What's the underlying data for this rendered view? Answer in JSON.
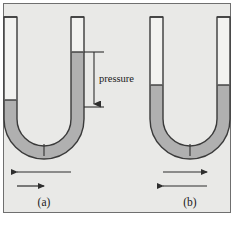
{
  "figure": {
    "background_color": "#e9e9e7",
    "border_color": "#6f6f6f",
    "fluid_color": "#b0b0b0",
    "tube_outline_color": "#3a3a3a",
    "empty_tube_color": "#f2f2f0",
    "arrow_color": "#2e2e2e",
    "text_color": "#1a1a1a"
  },
  "annotations": {
    "pressure_label": "pressure"
  },
  "panels": [
    {
      "id": "a",
      "caption": "(a)",
      "fluid_level_left": "low",
      "fluid_level_right": "high",
      "has_pressure_marker": true,
      "arrows": [
        {
          "name": "upper-arrow",
          "direction": "left",
          "length": "long"
        },
        {
          "name": "lower-arrow",
          "direction": "right",
          "length": "short"
        }
      ]
    },
    {
      "id": "b",
      "caption": "(b)",
      "fluid_level_left": "equal",
      "fluid_level_right": "equal",
      "has_pressure_marker": false,
      "arrows": [
        {
          "name": "upper-arrow",
          "direction": "right",
          "length": "short"
        },
        {
          "name": "lower-arrow",
          "direction": "left",
          "length": "long"
        }
      ]
    }
  ]
}
